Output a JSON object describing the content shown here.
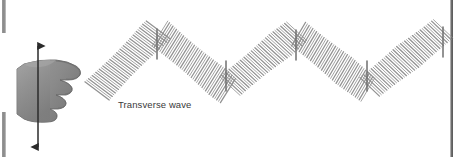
{
  "figure": {
    "width": 458,
    "height": 157,
    "background_color": "#ffffff"
  },
  "labels": {
    "wave_label": "Transverse wave"
  },
  "colors": {
    "coil_stroke": "#8c8c8c",
    "coil_stroke_dark": "#6f6f6f",
    "hand_fill": "#8f8f8f",
    "hand_shadow": "#6e6e6e",
    "hand_highlight": "#a9a9a9",
    "hand_outline": "#5f5f5f",
    "arrow_color": "#2b2b2b",
    "label_color": "#3a3a3a",
    "edge_bar_color": "#8e8e8e",
    "right_rule_color": "#5f5f5f"
  },
  "chart_data": {
    "type": "line",
    "title": "Transverse wave",
    "xlabel": "",
    "ylabel": "",
    "xlim": [
      95,
      446
    ],
    "ylim": [
      30,
      92
    ],
    "grid": false,
    "legend": null,
    "wave": {
      "start_point": {
        "x": 95,
        "y": 93
      },
      "vertices": [
        {
          "x": 95,
          "y": 93,
          "kind": "start"
        },
        {
          "x": 157,
          "y": 31,
          "kind": "crest"
        },
        {
          "x": 226,
          "y": 89,
          "kind": "trough"
        },
        {
          "x": 296,
          "y": 32,
          "kind": "crest"
        },
        {
          "x": 367,
          "y": 89,
          "kind": "trough"
        },
        {
          "x": 443,
          "y": 29,
          "kind": "crest"
        }
      ],
      "crest_count": 3,
      "trough_count": 2,
      "coil_count": 150,
      "coil_half_length": 15,
      "coil_spacing_px": 2.4
    },
    "hand_motion_arrow": {
      "orientation": "vertical",
      "double_headed": true,
      "x": 38,
      "y_top": 44,
      "y_bottom": 149
    }
  },
  "icons": {
    "hand": "hand-icon",
    "arrow": "double-arrow-vertical-icon",
    "coil": "slinky-coil-icon"
  }
}
